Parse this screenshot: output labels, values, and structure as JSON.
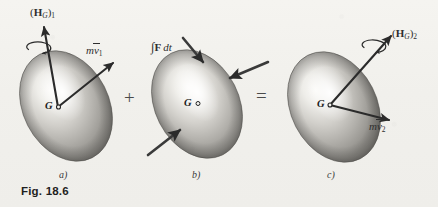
{
  "figure": {
    "caption": "Fig. 18.6",
    "background_color": "#f1f0ec",
    "ink_color": "#2e2e2e"
  },
  "operators": {
    "plus": "+",
    "equals": "="
  },
  "panels": [
    {
      "letter": "a)",
      "center_label": "G",
      "center_marker": "○",
      "vectors": [
        {
          "name": "angular-momentum-initial",
          "label_prefix": "(",
          "label_bold": "H",
          "label_sub_italic": "G",
          "label_mid": ")",
          "label_sub": "1",
          "label_plain": "(H_G)_1",
          "direction": "up-left",
          "has_spin_arrow": true
        },
        {
          "name": "linear-momentum-initial",
          "label_italic": "m",
          "label_vec": "v",
          "label_sub": "1",
          "label_plain": "m v_1",
          "direction": "up-right",
          "has_spin_arrow": false
        }
      ]
    },
    {
      "letter": "b)",
      "center_label": "G",
      "center_marker": "○",
      "vectors": [
        {
          "name": "linear-impulse",
          "label_integral": "∫",
          "label_bold": "F",
          "label_italic": "dt",
          "label_plain": "∫F dt",
          "direction": "inward",
          "has_spin_arrow": false
        }
      ],
      "impulse_arrow_count": 3
    },
    {
      "letter": "c)",
      "center_label": "G",
      "center_marker": "○",
      "vectors": [
        {
          "name": "angular-momentum-final",
          "label_prefix": "(",
          "label_bold": "H",
          "label_sub_italic": "G",
          "label_mid": ")",
          "label_sub": "2",
          "label_plain": "(H_G)_2",
          "direction": "up-right",
          "has_spin_arrow": true
        },
        {
          "name": "linear-momentum-final",
          "label_italic": "m",
          "label_vec": "v",
          "label_sub": "2",
          "label_plain": "m v_2",
          "direction": "right-down",
          "has_spin_arrow": false
        }
      ]
    }
  ]
}
